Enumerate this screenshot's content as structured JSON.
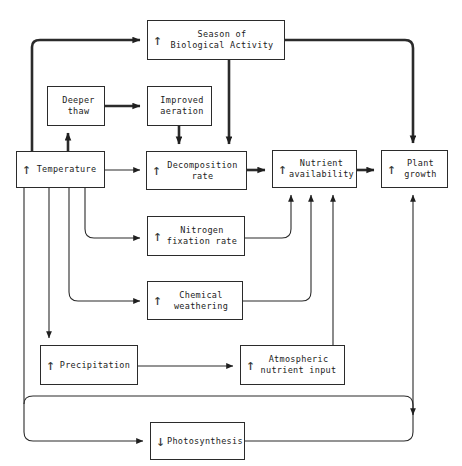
{
  "diagram": {
    "width": 462,
    "height": 466,
    "line_color": "#2b2b2b",
    "background_color": "#ffffff",
    "nodes": [
      {
        "id": "season",
        "label": "Season of\nBiological Activity",
        "trend": "up",
        "trend_glyph": "↑",
        "x": 147,
        "y": 20,
        "w": 138,
        "h": 40
      },
      {
        "id": "deeper-thaw",
        "label": "Deeper\nthaw",
        "trend": "none",
        "trend_glyph": "",
        "x": 47,
        "y": 86,
        "w": 58,
        "h": 40
      },
      {
        "id": "improved-aeration",
        "label": "Improved\naeration",
        "trend": "none",
        "trend_glyph": "",
        "x": 147,
        "y": 86,
        "w": 65,
        "h": 40
      },
      {
        "id": "temperature",
        "label": "Temperature",
        "trend": "up",
        "trend_glyph": "↑",
        "x": 16,
        "y": 151,
        "w": 89,
        "h": 37
      },
      {
        "id": "decomposition-rate",
        "label": "Decomposition\nrate",
        "trend": "up",
        "trend_glyph": "↑",
        "x": 146,
        "y": 151,
        "w": 101,
        "h": 39
      },
      {
        "id": "nutrient-availability",
        "label": "Nutrient\navailability",
        "trend": "up",
        "trend_glyph": "↑",
        "x": 272,
        "y": 150,
        "w": 85,
        "h": 38
      },
      {
        "id": "plant-growth",
        "label": "Plant\ngrowth",
        "trend": "up",
        "trend_glyph": "↑",
        "x": 381,
        "y": 150,
        "w": 67,
        "h": 38
      },
      {
        "id": "nitrogen-fixation-rate",
        "label": "Nitrogen\nfixation rate",
        "trend": "up",
        "trend_glyph": "↑",
        "x": 147,
        "y": 216,
        "w": 98,
        "h": 40
      },
      {
        "id": "chemical-weathering",
        "label": "Chemical\nweathering",
        "trend": "up",
        "trend_glyph": "↑",
        "x": 147,
        "y": 281,
        "w": 96,
        "h": 39
      },
      {
        "id": "precipitation",
        "label": "Precipitation",
        "trend": "up",
        "trend_glyph": "↑",
        "x": 40,
        "y": 345,
        "w": 98,
        "h": 40
      },
      {
        "id": "atmospheric-nutrient-input",
        "label": "Atmospheric\nnutrient input",
        "trend": "up",
        "trend_glyph": "↑",
        "x": 240,
        "y": 345,
        "w": 105,
        "h": 40
      },
      {
        "id": "photosynthesis",
        "label": "Photosynthesis",
        "trend": "down",
        "trend_glyph": "↓",
        "x": 150,
        "y": 422,
        "w": 95,
        "h": 38
      }
    ],
    "edges": [
      {
        "id": "temperature-to-season",
        "from": "temperature",
        "to": "season",
        "weight": "thick"
      },
      {
        "id": "temperature-to-deeper-thaw",
        "from": "temperature",
        "to": "deeper-thaw",
        "weight": "thick"
      },
      {
        "id": "deeper-thaw-to-improved-aeration",
        "from": "deeper-thaw",
        "to": "improved-aeration",
        "weight": "thick"
      },
      {
        "id": "improved-aeration-to-decomposition",
        "from": "improved-aeration",
        "to": "decomposition-rate",
        "weight": "thick"
      },
      {
        "id": "season-to-decomposition",
        "from": "season",
        "to": "decomposition-rate",
        "weight": "thick"
      },
      {
        "id": "season-to-plant-growth",
        "from": "season",
        "to": "plant-growth",
        "weight": "thick"
      },
      {
        "id": "temperature-to-decomposition",
        "from": "temperature",
        "to": "decomposition-rate",
        "weight": "thin"
      },
      {
        "id": "decomposition-to-nutrient",
        "from": "decomposition-rate",
        "to": "nutrient-availability",
        "weight": "thick"
      },
      {
        "id": "nutrient-to-plant-growth",
        "from": "nutrient-availability",
        "to": "plant-growth",
        "weight": "thick"
      },
      {
        "id": "temperature-to-nitrogen-fixation",
        "from": "temperature",
        "to": "nitrogen-fixation-rate",
        "weight": "thin"
      },
      {
        "id": "temperature-to-chemical-weathering",
        "from": "temperature",
        "to": "chemical-weathering",
        "weight": "thin"
      },
      {
        "id": "temperature-to-precipitation",
        "from": "temperature",
        "to": "precipitation",
        "weight": "thin"
      },
      {
        "id": "nitrogen-fixation-to-nutrient",
        "from": "nitrogen-fixation-rate",
        "to": "nutrient-availability",
        "weight": "thin"
      },
      {
        "id": "chemical-weathering-to-nutrient",
        "from": "chemical-weathering",
        "to": "nutrient-availability",
        "weight": "thin"
      },
      {
        "id": "precipitation-to-atmospheric-input",
        "from": "precipitation",
        "to": "atmospheric-nutrient-input",
        "weight": "thin"
      },
      {
        "id": "atmospheric-input-to-nutrient",
        "from": "atmospheric-nutrient-input",
        "to": "nutrient-availability",
        "weight": "thin"
      },
      {
        "id": "temperature-to-photosynthesis",
        "from": "temperature",
        "to": "photosynthesis",
        "weight": "thin"
      },
      {
        "id": "photosynthesis-to-plant-growth",
        "from": "photosynthesis",
        "to": "plant-growth",
        "weight": "thin"
      },
      {
        "id": "temperature-feedback-to-plant-growth",
        "from": "temperature",
        "to": "plant-growth",
        "weight": "thin"
      }
    ]
  }
}
